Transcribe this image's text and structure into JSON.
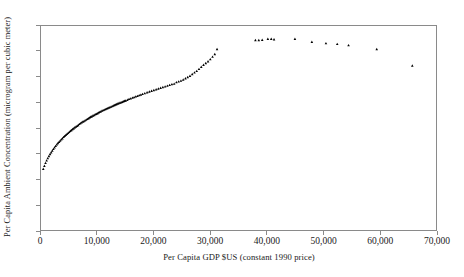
{
  "chart_data": {
    "type": "scatter",
    "title": "",
    "xlabel": "Per Capita GDP $US (constant 1990 price)",
    "ylabel": "Per Capita Ambient Concentration (microgram per cubic meter)",
    "xlim": [
      0,
      70000
    ],
    "ylim": [
      0,
      8
    ],
    "xticks": [
      0,
      10000,
      20000,
      30000,
      40000,
      50000,
      60000,
      70000
    ],
    "xtick_labels": [
      "0",
      "10,000",
      "20,000",
      "30,000",
      "40,000",
      "50,000",
      "60,000",
      "70,000"
    ],
    "yticks": [
      0,
      1,
      2,
      3,
      4,
      5,
      6,
      7,
      8
    ],
    "ytick_labels": [
      "0",
      "1",
      "2",
      "3",
      "4",
      "5",
      "6",
      "7",
      "8"
    ],
    "grid": false,
    "legend": null,
    "marker": "triangle",
    "marker_color": "#000000",
    "frame_color": "#8a8a8a",
    "series": [
      {
        "name": "Per capita ambient concentration vs per capita GDP",
        "points": [
          [
            400,
            2.4
          ],
          [
            600,
            2.52
          ],
          [
            800,
            2.63
          ],
          [
            1000,
            2.73
          ],
          [
            1200,
            2.82
          ],
          [
            1400,
            2.9
          ],
          [
            1600,
            2.98
          ],
          [
            1800,
            3.05
          ],
          [
            2000,
            3.12
          ],
          [
            2200,
            3.18
          ],
          [
            2400,
            3.24
          ],
          [
            2600,
            3.3
          ],
          [
            2800,
            3.36
          ],
          [
            3000,
            3.41
          ],
          [
            3200,
            3.46
          ],
          [
            3400,
            3.51
          ],
          [
            3600,
            3.56
          ],
          [
            3800,
            3.6
          ],
          [
            4000,
            3.65
          ],
          [
            4200,
            3.69
          ],
          [
            4400,
            3.73
          ],
          [
            4600,
            3.77
          ],
          [
            4800,
            3.81
          ],
          [
            5000,
            3.85
          ],
          [
            5200,
            3.89
          ],
          [
            5400,
            3.92
          ],
          [
            5600,
            3.96
          ],
          [
            5800,
            3.99
          ],
          [
            6000,
            4.03
          ],
          [
            6200,
            4.06
          ],
          [
            6400,
            4.09
          ],
          [
            6600,
            4.12
          ],
          [
            6800,
            4.16
          ],
          [
            7000,
            4.19
          ],
          [
            7200,
            4.22
          ],
          [
            7400,
            4.25
          ],
          [
            7600,
            4.27
          ],
          [
            7800,
            4.3
          ],
          [
            8000,
            4.33
          ],
          [
            8200,
            4.36
          ],
          [
            8400,
            4.38
          ],
          [
            8600,
            4.41
          ],
          [
            8800,
            4.44
          ],
          [
            9000,
            4.46
          ],
          [
            9200,
            4.49
          ],
          [
            9400,
            4.51
          ],
          [
            9600,
            4.54
          ],
          [
            9800,
            4.56
          ],
          [
            10000,
            4.58
          ],
          [
            10200,
            4.61
          ],
          [
            10400,
            4.63
          ],
          [
            10600,
            4.65
          ],
          [
            10800,
            4.68
          ],
          [
            11000,
            4.7
          ],
          [
            11200,
            4.72
          ],
          [
            11400,
            4.74
          ],
          [
            11600,
            4.76
          ],
          [
            11800,
            4.78
          ],
          [
            12000,
            4.8
          ],
          [
            12200,
            4.82
          ],
          [
            12400,
            4.84
          ],
          [
            12600,
            4.86
          ],
          [
            12800,
            4.88
          ],
          [
            13000,
            4.9
          ],
          [
            13200,
            4.92
          ],
          [
            13400,
            4.94
          ],
          [
            13600,
            4.96
          ],
          [
            13800,
            4.98
          ],
          [
            14000,
            5.0
          ],
          [
            14200,
            5.01
          ],
          [
            14400,
            5.03
          ],
          [
            14600,
            5.05
          ],
          [
            14800,
            5.07
          ],
          [
            15000,
            5.08
          ],
          [
            15300,
            5.11
          ],
          [
            15600,
            5.14
          ],
          [
            15900,
            5.16
          ],
          [
            16200,
            5.19
          ],
          [
            16500,
            5.21
          ],
          [
            16800,
            5.24
          ],
          [
            17100,
            5.26
          ],
          [
            17400,
            5.29
          ],
          [
            17700,
            5.31
          ],
          [
            18000,
            5.34
          ],
          [
            18400,
            5.37
          ],
          [
            18800,
            5.4
          ],
          [
            19200,
            5.43
          ],
          [
            19600,
            5.46
          ],
          [
            20000,
            5.49
          ],
          [
            20400,
            5.52
          ],
          [
            20800,
            5.55
          ],
          [
            21200,
            5.58
          ],
          [
            21600,
            5.61
          ],
          [
            22000,
            5.63
          ],
          [
            22400,
            5.66
          ],
          [
            22800,
            5.69
          ],
          [
            23200,
            5.72
          ],
          [
            23600,
            5.74
          ],
          [
            24000,
            5.8
          ],
          [
            24400,
            5.83
          ],
          [
            24800,
            5.86
          ],
          [
            25200,
            5.9
          ],
          [
            25600,
            5.95
          ],
          [
            26000,
            6.0
          ],
          [
            26400,
            6.05
          ],
          [
            26800,
            6.12
          ],
          [
            27200,
            6.18
          ],
          [
            27600,
            6.24
          ],
          [
            28000,
            6.32
          ],
          [
            28400,
            6.4
          ],
          [
            28800,
            6.48
          ],
          [
            29200,
            6.55
          ],
          [
            29600,
            6.62
          ],
          [
            30000,
            6.7
          ],
          [
            30400,
            6.8
          ],
          [
            30800,
            6.9
          ],
          [
            31200,
            7.1
          ],
          [
            38000,
            7.45
          ],
          [
            38600,
            7.45
          ],
          [
            39200,
            7.46
          ],
          [
            40200,
            7.5
          ],
          [
            40800,
            7.5
          ],
          [
            41300,
            7.48
          ],
          [
            45000,
            7.5
          ],
          [
            48000,
            7.38
          ],
          [
            50500,
            7.33
          ],
          [
            52500,
            7.3
          ],
          [
            54500,
            7.25
          ],
          [
            59500,
            7.1
          ],
          [
            65800,
            6.45
          ]
        ]
      }
    ]
  }
}
